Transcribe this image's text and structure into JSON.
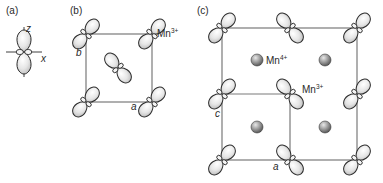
{
  "figure": {
    "panels": [
      {
        "id": "a",
        "label": "(a)",
        "axes": {
          "vertical": "z",
          "horizontal": "x"
        },
        "description": "single d(3z²−r²)-type orbital with large lobes along z and small ring lobes along x"
      },
      {
        "id": "b",
        "label": "(b)",
        "axis_labels": {
          "side": "b",
          "bottom": "a"
        },
        "ion_label": {
          "text": "Mn",
          "charge": "3+"
        },
        "orbitals": [
          {
            "position": "top-left",
            "orientation": "diagonal-right"
          },
          {
            "position": "top-right",
            "orientation": "diagonal-right"
          },
          {
            "position": "bottom-left",
            "orientation": "diagonal-right"
          },
          {
            "position": "bottom-right",
            "orientation": "diagonal-right"
          },
          {
            "position": "center",
            "orientation": "diagonal-left"
          }
        ]
      },
      {
        "id": "c",
        "label": "(c)",
        "axis_labels": {
          "side": "c",
          "bottom": "a"
        },
        "ion_labels": [
          {
            "text": "Mn",
            "charge": "4+"
          },
          {
            "text": "Mn",
            "charge": "3+"
          }
        ],
        "orbital_grid": {
          "rows": 3,
          "cols": 3,
          "orientations": [
            [
              "diagonal-right",
              "diagonal-left",
              "diagonal-right"
            ],
            [
              "diagonal-right",
              "diagonal-left",
              "diagonal-right"
            ],
            [
              "diagonal-right",
              "diagonal-left",
              "diagonal-right"
            ]
          ]
        },
        "spheres": {
          "count": 4,
          "species": "Mn4+"
        }
      }
    ],
    "colors": {
      "line": "#7a7a7a",
      "outline": "#2b2b2b",
      "lobe_light": "#f7f7f7",
      "lobe_dark": "#bdbdbd",
      "sphere_light": "#d8d8d8",
      "sphere_dark": "#555555",
      "text": "#2a2a2a"
    }
  }
}
